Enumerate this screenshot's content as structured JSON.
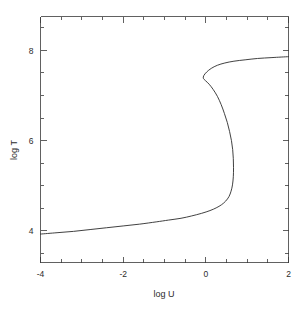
{
  "chart_data": {
    "type": "line",
    "title": "",
    "xlabel": "log U",
    "ylabel": "log T",
    "xlim": [
      -4,
      2
    ],
    "ylim": [
      3.3,
      8.75
    ],
    "grid": false,
    "legend": null,
    "x_ticks_major": [
      -4,
      -2,
      0,
      2
    ],
    "x_tick_labels": [
      "-4",
      "-2",
      "0",
      "2"
    ],
    "x_ticks_minor": [
      -3.5,
      -3,
      -2.5,
      -1.5,
      -1,
      -0.5,
      0.5,
      1,
      1.5
    ],
    "y_ticks_major": [
      4,
      6,
      8
    ],
    "y_tick_labels": [
      "4",
      "6",
      "8"
    ],
    "y_ticks_minor": [
      3.5,
      4.5,
      5,
      5.5,
      6.5,
      7,
      7.5,
      8.5
    ],
    "series": [
      {
        "name": "log T vs log U",
        "color": "#2b2b2b",
        "points": [
          [
            -4.0,
            3.93
          ],
          [
            -3.6,
            3.96
          ],
          [
            -3.2,
            3.99
          ],
          [
            -2.8,
            4.03
          ],
          [
            -2.4,
            4.07
          ],
          [
            -2.0,
            4.11
          ],
          [
            -1.6,
            4.15
          ],
          [
            -1.2,
            4.2
          ],
          [
            -0.9,
            4.24
          ],
          [
            -0.6,
            4.28
          ],
          [
            -0.35,
            4.33
          ],
          [
            -0.1,
            4.39
          ],
          [
            0.1,
            4.45
          ],
          [
            0.25,
            4.51
          ],
          [
            0.38,
            4.58
          ],
          [
            0.48,
            4.66
          ],
          [
            0.56,
            4.76
          ],
          [
            0.61,
            4.88
          ],
          [
            0.645,
            5.02
          ],
          [
            0.665,
            5.2
          ],
          [
            0.67,
            5.4
          ],
          [
            0.665,
            5.6
          ],
          [
            0.65,
            5.8
          ],
          [
            0.62,
            6.0
          ],
          [
            0.575,
            6.2
          ],
          [
            0.52,
            6.4
          ],
          [
            0.45,
            6.6
          ],
          [
            0.37,
            6.8
          ],
          [
            0.28,
            6.98
          ],
          [
            0.18,
            7.13
          ],
          [
            0.08,
            7.25
          ],
          [
            -0.01,
            7.33
          ],
          [
            -0.06,
            7.38
          ],
          [
            -0.05,
            7.44
          ],
          [
            0.02,
            7.52
          ],
          [
            0.13,
            7.6
          ],
          [
            0.28,
            7.67
          ],
          [
            0.46,
            7.72
          ],
          [
            0.68,
            7.76
          ],
          [
            0.95,
            7.79
          ],
          [
            1.25,
            7.82
          ],
          [
            1.6,
            7.84
          ],
          [
            2.0,
            7.86
          ]
        ]
      }
    ]
  },
  "axes": {
    "x_title": "log U",
    "y_title": "log T"
  }
}
